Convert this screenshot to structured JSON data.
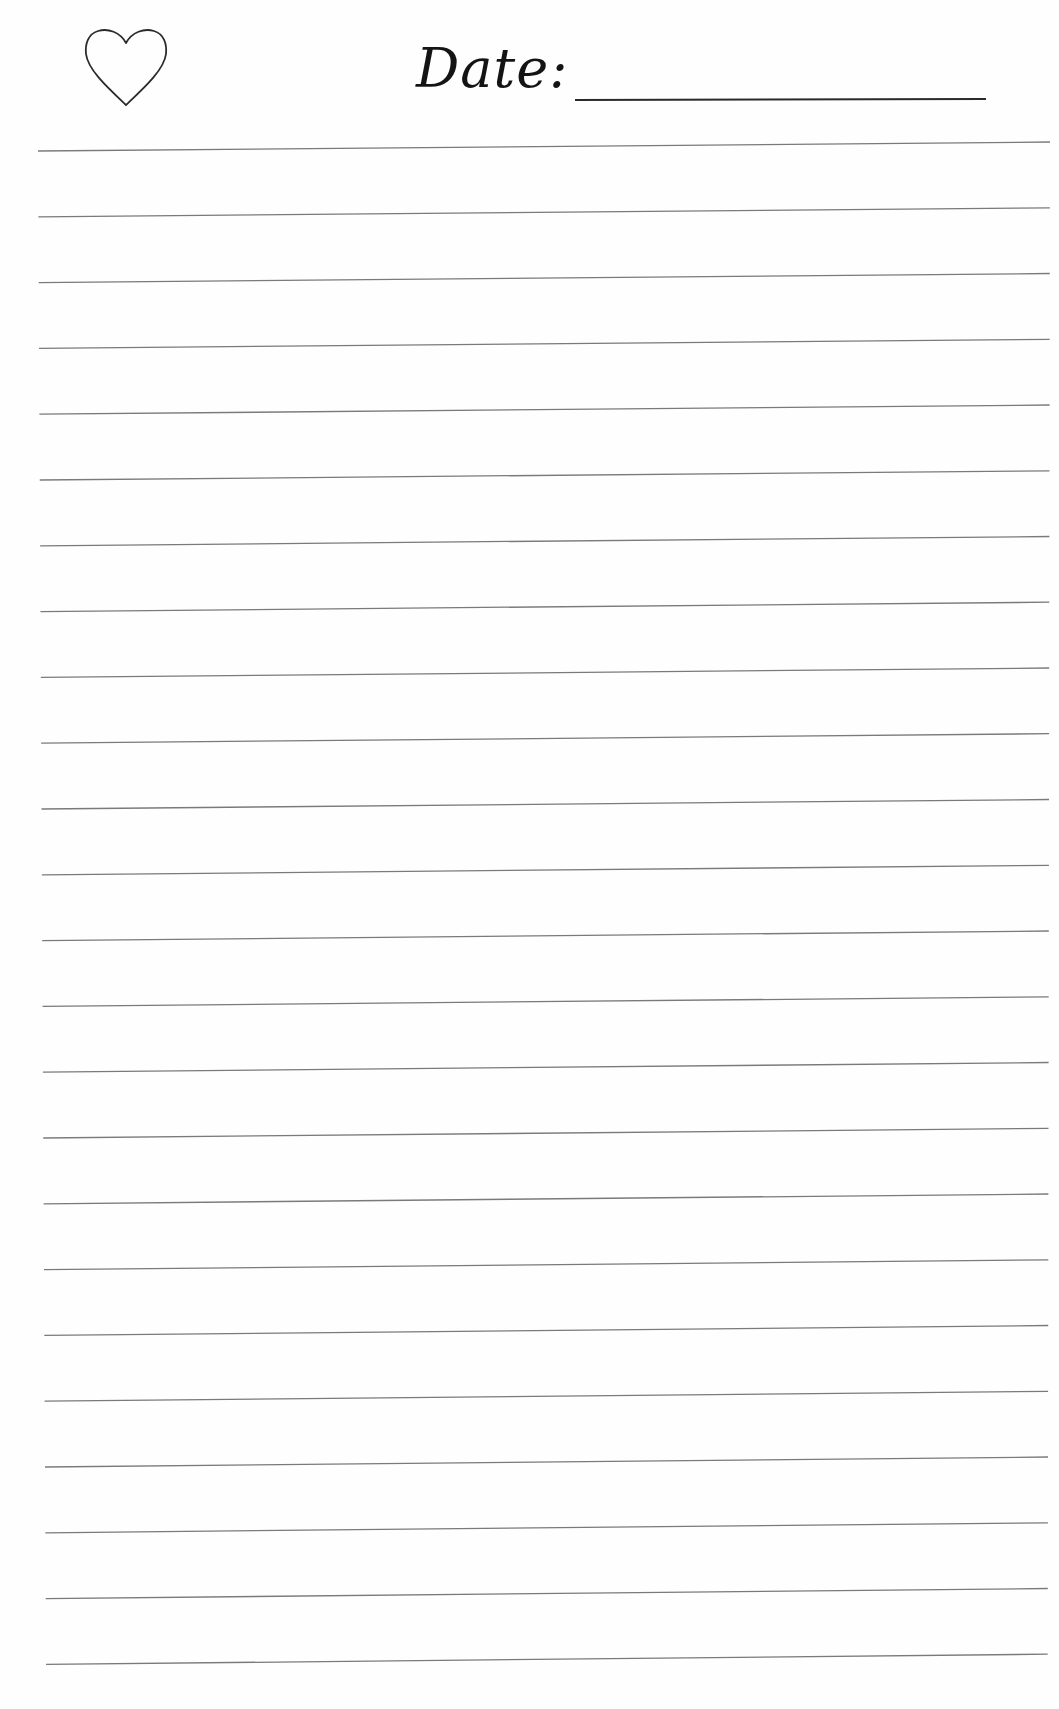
{
  "header": {
    "icon": "heart-outline-icon",
    "date_label": "Date:",
    "date_value": ""
  },
  "ruled_lines": {
    "count": 24,
    "first_left_y": 151,
    "first_right_y": 142,
    "spacing": 65.8,
    "x_start": 38,
    "x_end": 1050,
    "color": "#7a7a7a"
  },
  "colors": {
    "ink": "#141414",
    "paper": "#fefefe",
    "rule": "#7a7a7a"
  }
}
